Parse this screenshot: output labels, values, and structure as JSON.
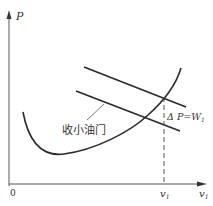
{
  "diagram": {
    "axes": {
      "y_label": "P",
      "x_label": "v",
      "x_label_sub": "1",
      "origin_label": "0"
    },
    "marker": {
      "label": "v",
      "label_sub": "1"
    },
    "annotation": {
      "delta_text": "Δ P=W",
      "delta_sub": "1",
      "throttle_label": "收小油门"
    },
    "colors": {
      "line": "#2a2a2a",
      "axis": "#555555",
      "background": "#ffffff"
    }
  }
}
